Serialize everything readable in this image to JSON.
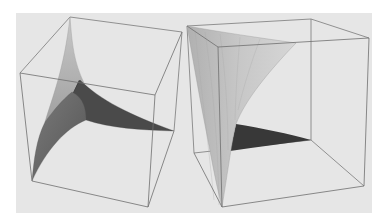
{
  "figure": {
    "background_color": "#e6e6e6",
    "edge_color": "#6e6e6e",
    "plots": [
      {
        "id": "left-plot",
        "label": "Surface plot (left view)",
        "surface_light": "#b8b8b8",
        "surface_mid": "#6a6a6a",
        "surface_dark": "#3c3c3c"
      },
      {
        "id": "right-plot",
        "label": "Surface plot (right view)",
        "surface_light": "#c4c4c4",
        "surface_mid": "#a8a8a8",
        "surface_dark": "#383838"
      }
    ]
  }
}
